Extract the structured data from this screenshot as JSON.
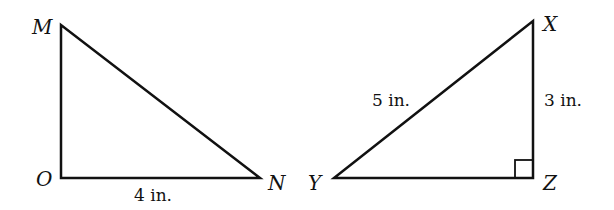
{
  "figure": {
    "triangles": [
      {
        "name": "MON",
        "vertices": {
          "M": "M",
          "O": "O",
          "N": "N"
        },
        "side_labels": {
          "ON": "4 in."
        },
        "right_angle_marked": false
      },
      {
        "name": "XYZ",
        "vertices": {
          "X": "X",
          "Y": "Y",
          "Z": "Z"
        },
        "side_labels": {
          "XY": "5 in.",
          "XZ": "3 in."
        },
        "right_angle_marked": true,
        "right_angle_at": "Z"
      }
    ],
    "stroke_color": "#111111",
    "background": "#ffffff"
  }
}
